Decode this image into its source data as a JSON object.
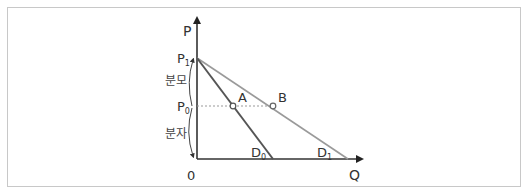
{
  "diagram": {
    "axes": {
      "y_label": "P",
      "x_label": "Q",
      "origin_label": "0"
    },
    "price_levels": [
      {
        "name": "P",
        "sub": "1",
        "id": "p1"
      },
      {
        "name": "P",
        "sub": "0",
        "id": "p0"
      }
    ],
    "segments": {
      "upper": "분모",
      "lower": "분자"
    },
    "points": [
      {
        "label": "A",
        "on": "D0",
        "at": "P0"
      },
      {
        "label": "B",
        "on": "D1",
        "at": "P0"
      }
    ],
    "curves": [
      {
        "name": "D",
        "sub": "0",
        "color": "#555555"
      },
      {
        "name": "D",
        "sub": "1",
        "color": "#999999"
      }
    ],
    "colors": {
      "axis": "#333333",
      "d0": "#555555",
      "d1": "#9a9a9a",
      "dotted": "#999999",
      "frame": "#c8c8c8"
    }
  }
}
